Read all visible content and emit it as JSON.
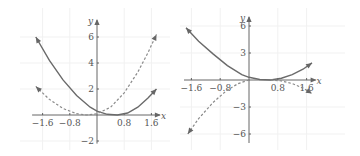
{
  "chart_data": [
    {
      "type": "line",
      "title": "",
      "xlabel": "x",
      "ylabel": "y",
      "xlim": [
        -1.85,
        1.85
      ],
      "ylim": [
        -2.2,
        7.3
      ],
      "x_ticks": [
        -1.6,
        -0.8,
        0.8,
        1.6
      ],
      "x_tick_labels": [
        "−1.6",
        "−0.8",
        "0.8",
        "1.6"
      ],
      "y_ticks": [
        6,
        4,
        2,
        -2
      ],
      "y_tick_labels": [
        "6",
        "4",
        "2",
        "−2"
      ],
      "grid": true,
      "series": [
        {
          "name": "solid",
          "style": "solid",
          "x": [
            -1.8,
            -1.4,
            -1.0,
            -0.6,
            -0.2,
            0.0,
            0.3,
            0.6,
            0.9,
            1.2,
            1.5,
            1.75
          ],
          "y": [
            6.0,
            4.2,
            2.7,
            1.5,
            0.6,
            0.3,
            0.05,
            0.0,
            0.15,
            0.6,
            1.3,
            2.0
          ]
        },
        {
          "name": "dashed",
          "style": "dashed",
          "x": [
            -1.8,
            -1.4,
            -1.0,
            -0.6,
            -0.3,
            0.0,
            0.4,
            0.8,
            1.2,
            1.5,
            1.75
          ],
          "y": [
            2.2,
            1.2,
            0.5,
            0.1,
            0.0,
            0.1,
            0.6,
            1.7,
            3.3,
            4.8,
            6.2
          ]
        }
      ]
    },
    {
      "type": "line",
      "title": "",
      "xlabel": "x",
      "ylabel": "y",
      "xlim": [
        -1.75,
        1.85
      ],
      "ylim": [
        -7.0,
        7.0
      ],
      "x_ticks": [
        -1.6,
        -0.8,
        0.8,
        1.6
      ],
      "x_tick_labels": [
        "−1.6",
        "−0.8",
        "0.8",
        "1.6"
      ],
      "y_ticks": [
        6,
        3,
        -3,
        -6
      ],
      "y_tick_labels": [
        "6",
        "3",
        "−3",
        "−6"
      ],
      "grid": true,
      "series": [
        {
          "name": "solid",
          "style": "solid",
          "x": [
            -1.75,
            -1.4,
            -1.0,
            -0.6,
            -0.2,
            0.0,
            0.3,
            0.6,
            0.9,
            1.2,
            1.5,
            1.75
          ],
          "y": [
            5.8,
            4.3,
            2.9,
            1.6,
            0.6,
            0.3,
            0.05,
            0.0,
            0.2,
            0.6,
            1.2,
            1.9
          ]
        },
        {
          "name": "dashed-left",
          "style": "dashed",
          "x": [
            -1.7,
            -1.4,
            -1.0,
            -0.6,
            -0.3,
            0.0
          ],
          "y": [
            -6.0,
            -4.3,
            -2.5,
            -1.1,
            -0.4,
            0.0
          ]
        },
        {
          "name": "dashed-right",
          "style": "dashed",
          "x": [
            0.6,
            0.9,
            1.2,
            1.5,
            1.75
          ],
          "y": [
            0.0,
            -0.1,
            -0.4,
            -0.9,
            -1.5
          ]
        }
      ]
    }
  ]
}
